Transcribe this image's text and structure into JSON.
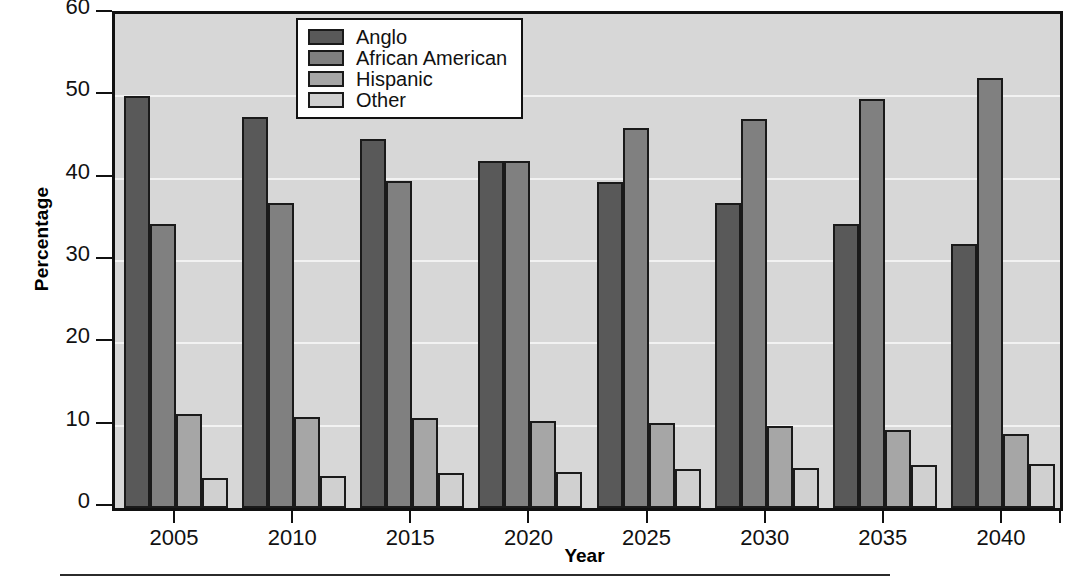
{
  "chart_data": {
    "type": "bar",
    "title": "",
    "xlabel": "Year",
    "ylabel": "Percentage",
    "categories": [
      "2005",
      "2010",
      "2015",
      "2020",
      "2025",
      "2030",
      "2035",
      "2040"
    ],
    "series": [
      {
        "name": "Anglo",
        "color": "#595959",
        "values": [
          50.1,
          47.5,
          44.8,
          42.2,
          39.6,
          37.1,
          34.5,
          32.1
        ]
      },
      {
        "name": "African American",
        "color": "#808080",
        "values": [
          34.5,
          37.1,
          39.7,
          42.1,
          46.1,
          47.2,
          49.7,
          52.2
        ]
      },
      {
        "name": "Hispanic",
        "color": "#a6a6a6",
        "values": [
          11.4,
          11.1,
          10.9,
          10.6,
          10.3,
          10.0,
          9.5,
          9.0
        ]
      },
      {
        "name": "Other",
        "color": "#d0d0d0",
        "values": [
          3.6,
          3.9,
          4.2,
          4.4,
          4.7,
          4.9,
          5.2,
          5.4
        ]
      }
    ],
    "ylim": [
      0,
      60
    ],
    "yticks": [
      0,
      10,
      20,
      30,
      40,
      50,
      60
    ],
    "ytick_labels": [
      "0",
      "10",
      "20",
      "30",
      "40",
      "50",
      "60"
    ],
    "grid": true,
    "legend_position": "top-center",
    "plot_background": "#d7d7d7"
  },
  "legend": {
    "entries": [
      {
        "label": "Anglo"
      },
      {
        "label": "African American"
      },
      {
        "label": "Hispanic"
      },
      {
        "label": "Other"
      }
    ]
  }
}
